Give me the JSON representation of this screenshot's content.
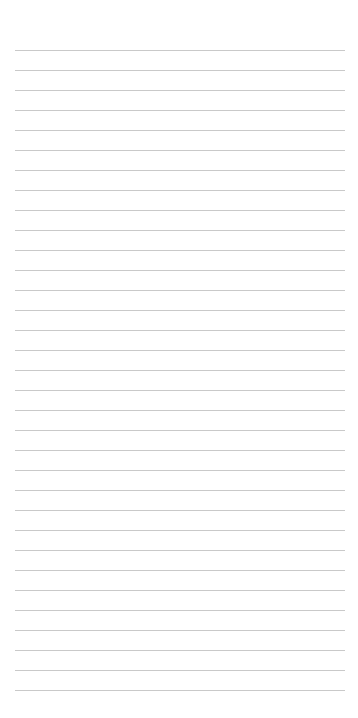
{
  "page": {
    "type": "lined-paper",
    "background_color": "#ffffff",
    "rule_color": "#c9c9c9"
  },
  "rules": {
    "count": 33,
    "first_y": 50,
    "spacing": 20,
    "left": 15,
    "right": 345
  }
}
